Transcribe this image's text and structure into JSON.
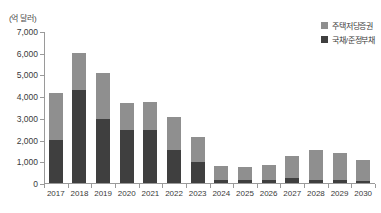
{
  "chart_data": {
    "type": "bar",
    "stacked": true,
    "title": "",
    "subtitle": "",
    "unit_label": "(억 달러)",
    "xlabel": "",
    "ylabel": "",
    "ylim": [
      0,
      7000
    ],
    "ytick_values": [
      0,
      1000,
      2000,
      3000,
      4000,
      5000,
      6000,
      7000
    ],
    "ytick_labels": [
      "0",
      "1,000",
      "2,000",
      "3,000",
      "4,000",
      "5,000",
      "6,000",
      "7,000"
    ],
    "grid": false,
    "legend_position": "top-right",
    "categories": [
      "2017",
      "2018",
      "2019",
      "2020",
      "2021",
      "2022",
      "2023",
      "2024",
      "2025",
      "2026",
      "2027",
      "2028",
      "2029",
      "2030"
    ],
    "series": [
      {
        "name": "국채/준정부채",
        "color": "#3f3f3f",
        "values": [
          2000,
          4300,
          2950,
          2450,
          2450,
          1500,
          950,
          150,
          150,
          150,
          250,
          150,
          150,
          100
        ]
      },
      {
        "name": "주택저당증권",
        "color": "#8f8f8f",
        "values": [
          2150,
          1700,
          2100,
          1250,
          1300,
          1550,
          1150,
          650,
          600,
          700,
          1000,
          1350,
          1250,
          950
        ]
      }
    ],
    "totals": [
      4150,
      6000,
      5050,
      3700,
      3750,
      3050,
      2100,
      800,
      750,
      850,
      1250,
      1500,
      1400,
      1050
    ]
  },
  "legend": {
    "items": [
      {
        "label": "주택저당증권",
        "color": "#8f8f8f"
      },
      {
        "label": "국채/준정부채",
        "color": "#3f3f3f"
      }
    ]
  },
  "axis": {
    "unit": "(억 달러)"
  }
}
